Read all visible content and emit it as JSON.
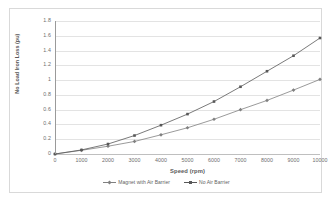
{
  "chart_data": {
    "type": "line",
    "title": "",
    "xlabel": "Speed (rpm)",
    "ylabel": "No Load Iron Loss (pu)",
    "x": [
      0,
      1000,
      2000,
      3000,
      4000,
      5000,
      6000,
      7000,
      8000,
      9000,
      10000
    ],
    "xtick_labels": [
      "0",
      "1000",
      "2000",
      "3000",
      "4000",
      "5000",
      "6000",
      "7000",
      "8000",
      "9000",
      "10000"
    ],
    "ytick_labels": [
      "0",
      "0.2",
      "0.4",
      "0.6",
      "0.8",
      "1",
      "1.2",
      "1.4",
      "1.6",
      "1.8"
    ],
    "ytick_values": [
      0,
      0.2,
      0.4,
      0.6,
      0.8,
      1,
      1.2,
      1.4,
      1.6,
      1.8
    ],
    "xlim": [
      0,
      10000
    ],
    "ylim": [
      0,
      1.8
    ],
    "grid": "horizontal",
    "legend_position": "bottom",
    "series": [
      {
        "name": "Magnet with Air Barrier",
        "marker": "diamond",
        "color": "#808080",
        "values": [
          0,
          0.05,
          0.105,
          0.17,
          0.26,
          0.355,
          0.47,
          0.6,
          0.725,
          0.865,
          1.01
        ]
      },
      {
        "name": "No Air Barrier",
        "marker": "square",
        "color": "#585858",
        "values": [
          0,
          0.055,
          0.135,
          0.25,
          0.39,
          0.54,
          0.71,
          0.91,
          1.12,
          1.33,
          1.57
        ]
      }
    ]
  },
  "colors": {
    "plot_background": "#ffffff",
    "gridline": "#e3e3e3",
    "axis_line": "#9a9a9a",
    "frame_border": "#d9d9d9",
    "tick_label": "#6e6e6e",
    "axis_title": "#5a5a5a"
  }
}
